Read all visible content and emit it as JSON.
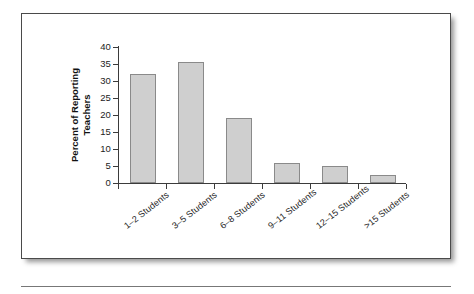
{
  "figure": {
    "background_color": "#ffffff",
    "frame_color": "#4a4a4a",
    "bar_fill_color": "#cfcfcf",
    "bar_edge_color": "#8a8a8a",
    "axis_color": "#3b3b3b"
  },
  "chart_data": {
    "type": "bar",
    "title": "",
    "subtitle": "",
    "xlabel": "",
    "ylabel": "Percent of Reporting Teachers",
    "ylabel_line1": "Percent of Reporting",
    "ylabel_line2": "Teachers",
    "categories": [
      "1–2 Students",
      "3–5 Students",
      "6–8 Students",
      "9–11 Students",
      "12–15 Students",
      ">15 Students"
    ],
    "values": [
      32,
      35.5,
      19,
      6,
      5,
      2.5
    ],
    "ylim": [
      0,
      40
    ],
    "ytick_values": [
      0,
      5,
      10,
      15,
      20,
      25,
      30,
      35,
      40
    ],
    "ytick_labels": [
      "0",
      "5",
      "10",
      "15",
      "20",
      "25",
      "30",
      "35",
      "40"
    ],
    "grid": false,
    "legend": null,
    "legend_position": "none",
    "annotations": []
  }
}
